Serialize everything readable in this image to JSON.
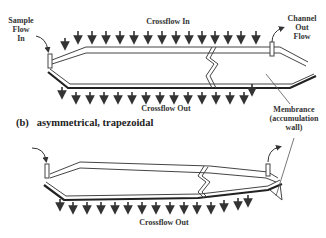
{
  "diagram_a": {
    "labels": {
      "sample_flow_in": [
        "Sample",
        "Flow",
        "In"
      ],
      "crossflow_in": "Crossflow In",
      "channel_out_flow": [
        "Channel",
        "Out",
        "Flow"
      ],
      "crossflow_out": "Crossflow Out"
    }
  },
  "diagram_b": {
    "caption": "(b)   asymmetrical, trapezoidal",
    "labels": {
      "membrane": [
        "Membrance",
        "(accumulation",
        "wall)"
      ],
      "crossflow_out": "Crossflow Out"
    }
  },
  "colors": {
    "line": "#333333",
    "background": "#ffffff"
  }
}
